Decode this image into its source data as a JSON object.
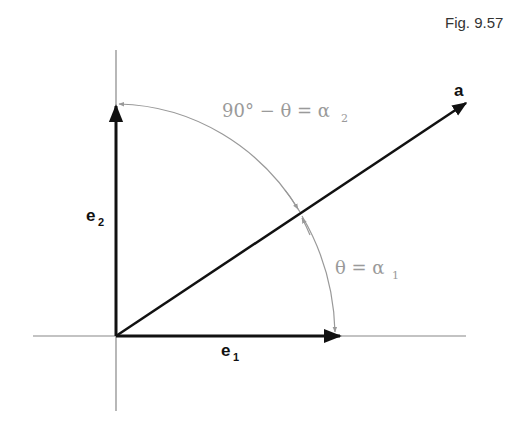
{
  "figure": {
    "caption": "Fig. 9.57"
  },
  "diagram": {
    "vectors": [
      {
        "name": "e1",
        "label": "e",
        "subscript": "1"
      },
      {
        "name": "e2",
        "label": "e",
        "subscript": "2"
      },
      {
        "name": "a",
        "label": "a"
      }
    ],
    "angles": {
      "upper": "90° − θ = α",
      "upper_sub": "2",
      "lower": "θ = α",
      "lower_sub": "1"
    },
    "colors": {
      "vector": "#111111",
      "axis": "#888888",
      "arc": "#999999",
      "angle_text": "#9a9a9a"
    }
  }
}
